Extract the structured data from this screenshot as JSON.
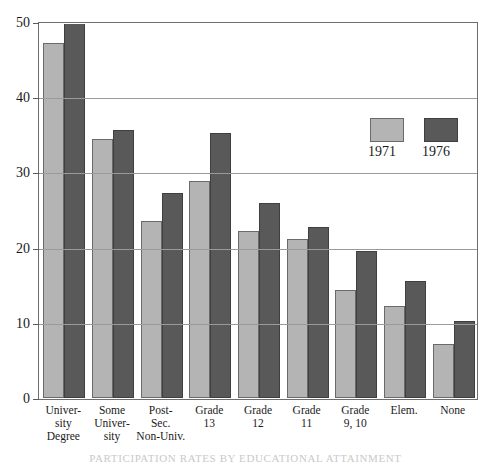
{
  "chart_data": {
    "type": "bar",
    "title": "",
    "xlabel": "",
    "ylabel": "",
    "ylim": [
      0,
      50
    ],
    "yticks": [
      0,
      10,
      20,
      30,
      40,
      50
    ],
    "ytick_labels": [
      "0",
      "10",
      "20",
      "30",
      "40",
      "50"
    ],
    "grid": true,
    "legend_position": "upper-right",
    "categories": [
      "University Degree",
      "Some University",
      "Post-Sec. Non-Univ.",
      "Grade 13",
      "Grade 12",
      "Grade 11",
      "Grade 9, 10",
      "Elem.",
      "None"
    ],
    "category_lines": [
      [
        "Univer-",
        "sity",
        "Degree"
      ],
      [
        "Some",
        "Univer-",
        "sity"
      ],
      [
        "Post-",
        "Sec.",
        "Non-Univ."
      ],
      [
        "Grade",
        "13"
      ],
      [
        "Grade",
        "12"
      ],
      [
        "Grade",
        "11"
      ],
      [
        "Grade",
        "9, 10"
      ],
      [
        "Elem."
      ],
      [
        "None"
      ]
    ],
    "series": [
      {
        "name": "1971",
        "color": "#b4b4b4",
        "values": [
          47.2,
          34.4,
          23.6,
          28.9,
          22.2,
          21.2,
          14.4,
          12.3,
          7.2
        ]
      },
      {
        "name": "1976",
        "color": "#595959",
        "values": [
          52.0,
          35.7,
          27.3,
          35.3,
          25.9,
          22.8,
          19.5,
          15.5,
          10.3
        ],
        "notes": "First bar (University Degree, 1976) is clipped by the top of the plot frame at 50."
      }
    ],
    "annotations": []
  },
  "legend": {
    "items": [
      {
        "label": "1971",
        "color": "#b4b4b4"
      },
      {
        "label": "1976",
        "color": "#595959"
      }
    ]
  },
  "caption": {
    "cropped_line": "PARTICIPATION RATES BY EDUCATIONAL ATTAINMENT"
  }
}
